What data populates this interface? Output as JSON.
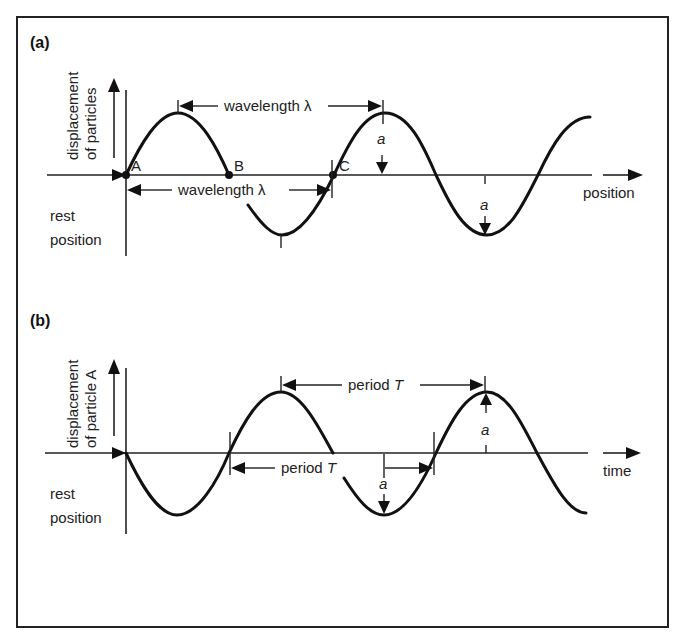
{
  "panel_a": {
    "label": "(a)",
    "y_axis_label_line1": "displacement",
    "y_axis_label_line2": "of particles",
    "x_axis_label": "position",
    "rest_label_line1": "rest",
    "rest_label_line2": "position",
    "points": {
      "A": "A",
      "B": "B",
      "C": "C"
    },
    "wavelength_upper": "wavelength λ",
    "wavelength_lower": "wavelength λ",
    "amplitude_label_crest": "a",
    "amplitude_label_trough": "a"
  },
  "panel_b": {
    "label": "(b)",
    "y_axis_label_line1": "displacement",
    "y_axis_label_line2": "of particle A",
    "x_axis_label": "time",
    "rest_label_line1": "rest",
    "rest_label_line2": "position",
    "period_upper_text": "period ",
    "period_upper_symbol": "T",
    "period_lower_text": "period ",
    "period_lower_symbol": "T",
    "amplitude_label_crest": "a",
    "amplitude_label_trough": "a"
  },
  "colors": {
    "ink": "#111111",
    "background": "#ffffff"
  }
}
